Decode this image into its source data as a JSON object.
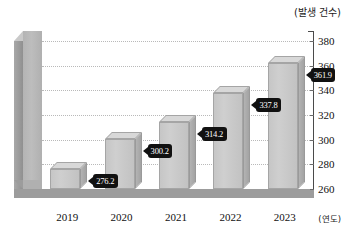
{
  "chart_data": {
    "type": "bar",
    "title": "",
    "subtitle": "",
    "unit_label_y": "(발생 건수)",
    "unit_label_x": "(연도)",
    "xlabel": "",
    "ylabel": "",
    "categories": [
      "2019",
      "2020",
      "2021",
      "2022",
      "2023"
    ],
    "values": [
      276.2,
      300.2,
      314.2,
      337.8,
      361.9
    ],
    "data_labels": [
      "276.2",
      "300.2",
      "314.2",
      "337.8",
      "361.9"
    ],
    "ylim": [
      260,
      380
    ],
    "yticks": [
      260,
      280,
      300,
      320,
      340,
      360,
      380
    ],
    "ytick_labels": [
      "260",
      "280",
      "300",
      "320",
      "340",
      "360",
      "380"
    ],
    "grid": true,
    "grid_style": "dotted",
    "legend": false,
    "legend_position": "none",
    "axis_position": "right",
    "style_3d": true,
    "colors": {
      "bar_face": "#cfcfcf",
      "bar_top": "#d8d8d8",
      "bar_side": "#b0b0b0",
      "wall": "#b8b8b8",
      "floor": "#9c9c9c",
      "grid": "#b9b9b9",
      "axis": "#4a4a4a",
      "label_background": "#111111",
      "label_text": "#ffffff",
      "text": "#111111",
      "plot_background": "#ffffff"
    }
  }
}
